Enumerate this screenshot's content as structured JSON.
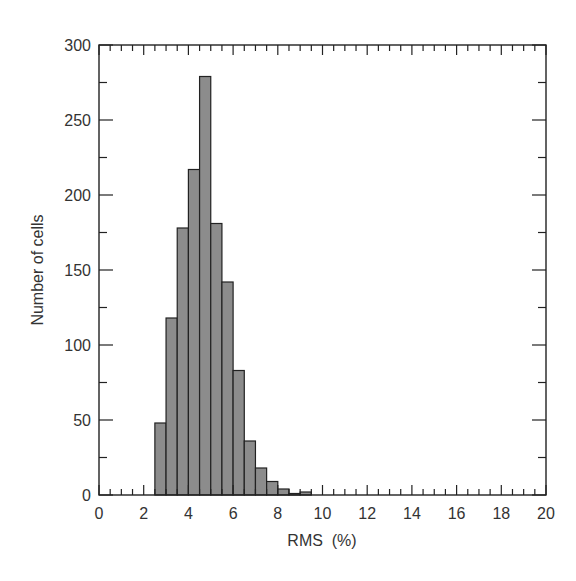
{
  "chart_data": {
    "type": "bar",
    "subtype": "histogram",
    "title": "",
    "xlabel": "RMS  (%)",
    "ylabel": "Number of cells",
    "xlim": [
      0,
      20
    ],
    "ylim": [
      0,
      300
    ],
    "bin_width": 0.5,
    "x_ticks": [
      0,
      2,
      4,
      6,
      8,
      10,
      12,
      14,
      16,
      18,
      20
    ],
    "x_minor_step": 0.5,
    "y_ticks": [
      0,
      50,
      100,
      150,
      200,
      250,
      300
    ],
    "y_minor_step": 25,
    "grid": false,
    "legend": null,
    "fill_color": "#8c8c8c",
    "edge_color": "#222222",
    "bins": [
      {
        "x0": 2.5,
        "x1": 3.0,
        "count": 48
      },
      {
        "x0": 3.0,
        "x1": 3.5,
        "count": 118
      },
      {
        "x0": 3.5,
        "x1": 4.0,
        "count": 178
      },
      {
        "x0": 4.0,
        "x1": 4.5,
        "count": 217
      },
      {
        "x0": 4.5,
        "x1": 5.0,
        "count": 279
      },
      {
        "x0": 5.0,
        "x1": 5.5,
        "count": 181
      },
      {
        "x0": 5.5,
        "x1": 6.0,
        "count": 142
      },
      {
        "x0": 6.0,
        "x1": 6.5,
        "count": 83
      },
      {
        "x0": 6.5,
        "x1": 7.0,
        "count": 36
      },
      {
        "x0": 7.0,
        "x1": 7.5,
        "count": 18
      },
      {
        "x0": 7.5,
        "x1": 8.0,
        "count": 9
      },
      {
        "x0": 8.0,
        "x1": 8.5,
        "count": 4
      },
      {
        "x0": 8.5,
        "x1": 9.0,
        "count": 1
      },
      {
        "x0": 9.0,
        "x1": 9.5,
        "count": 2
      }
    ],
    "categories": [
      "2.5-3.0",
      "3.0-3.5",
      "3.5-4.0",
      "4.0-4.5",
      "4.5-5.0",
      "5.0-5.5",
      "5.5-6.0",
      "6.0-6.5",
      "6.5-7.0",
      "7.0-7.5",
      "7.5-8.0",
      "8.0-8.5",
      "8.5-9.0",
      "9.0-9.5"
    ],
    "values": [
      48,
      118,
      178,
      217,
      279,
      181,
      142,
      83,
      36,
      18,
      9,
      4,
      1,
      2
    ]
  }
}
